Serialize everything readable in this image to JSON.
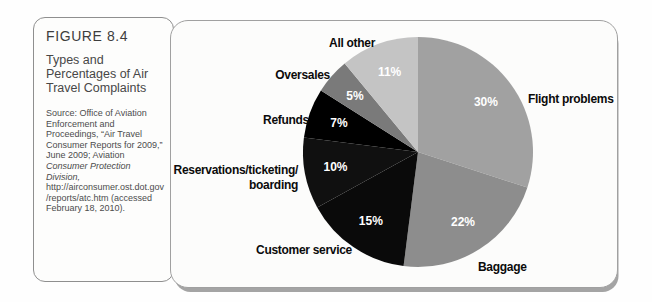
{
  "figure": {
    "label": "FIGURE 8.4",
    "title": "Types and Percentages of Air Travel Complaints",
    "source_prefix": "Source: Office of Aviation Enforcement and Proceedings, “Air Travel Consumer Reports for 2009,” June 2009; Aviation ",
    "source_italic": "Consumer Protection Division,",
    "source_suffix": " http://airconsumer.ost.dot.gov/reports/atc.htm (accessed February 18, 2010)."
  },
  "chart_data": {
    "type": "pie",
    "title": "Types and Percentages of Air Travel Complaints",
    "start_angle_deg": 0,
    "direction": "clockwise",
    "labels_position": "outside",
    "pct_label_color": "#ffffff",
    "label_color": "#0b0b0b",
    "slices": [
      {
        "label": "Flight problems",
        "value": 30,
        "pct_label": "30%",
        "color": "#a1a1a1"
      },
      {
        "label": "Baggage",
        "value": 22,
        "pct_label": "22%",
        "color": "#8d8d8d"
      },
      {
        "label": "Customer service",
        "value": 15,
        "pct_label": "15%",
        "color": "#0a0a0a"
      },
      {
        "label": "Reservations/ticketing/boarding",
        "value": 10,
        "pct_label": "10%",
        "color": "#101010",
        "label_lines": [
          "Reservations/ticketing/",
          "boarding"
        ]
      },
      {
        "label": "Refunds",
        "value": 7,
        "pct_label": "7%",
        "color": "#000000"
      },
      {
        "label": "Oversales",
        "value": 5,
        "pct_label": "5%",
        "color": "#7a7a7a"
      },
      {
        "label": "All other",
        "value": 11,
        "pct_label": "11%",
        "color": "#c4c4c4"
      }
    ]
  }
}
